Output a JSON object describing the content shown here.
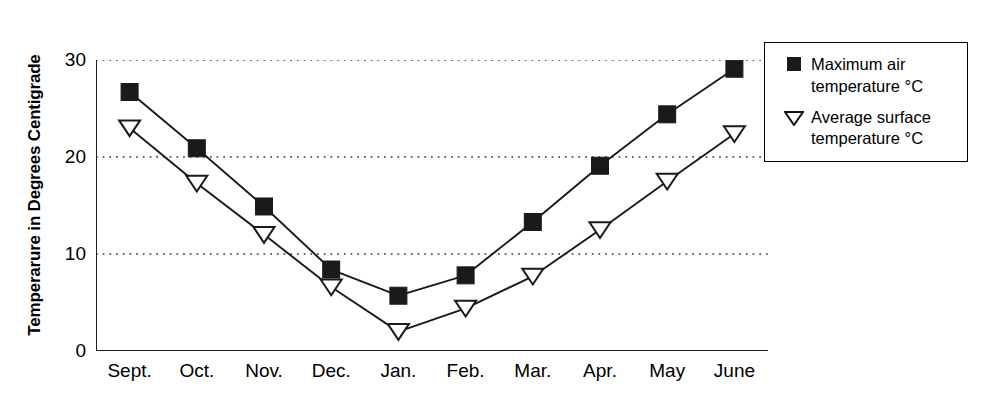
{
  "chart_data": {
    "type": "line",
    "title": "",
    "xlabel": "",
    "ylabel": "Temperarure in Degrees Centigrade",
    "categories": [
      "Sept.",
      "Oct.",
      "Nov.",
      "Dec.",
      "Jan.",
      "Feb.",
      "Mar.",
      "Apr.",
      "May",
      "June"
    ],
    "ylim": [
      0,
      30
    ],
    "yticks": [
      0,
      10,
      20,
      30
    ],
    "ytick_labels": [
      "0",
      "10",
      "20",
      "30"
    ],
    "grid": "horizontal-dotted",
    "legend_position": "right",
    "series": [
      {
        "name": "Maximum air temperature °C",
        "marker": "filled-square",
        "color": "#1a1a1a",
        "values": [
          26.7,
          20.9,
          14.9,
          8.4,
          5.7,
          7.8,
          13.3,
          19.1,
          24.4,
          29.1
        ]
      },
      {
        "name": "Average surface temperature °C",
        "marker": "open-down-triangle",
        "color": "#1a1a1a",
        "values": [
          23.0,
          17.3,
          12.0,
          6.6,
          2.0,
          4.4,
          7.7,
          12.5,
          17.5,
          22.4
        ]
      }
    ]
  },
  "legend": {
    "items": [
      {
        "marker": "filled-square",
        "line1": "Maximum air",
        "line2": "temperature °C"
      },
      {
        "marker": "open-down-triangle",
        "line1": "Average surface",
        "line2": "temperature °C"
      }
    ]
  },
  "axis": {
    "y_title": "Temperarure in Degrees Centigrade"
  }
}
